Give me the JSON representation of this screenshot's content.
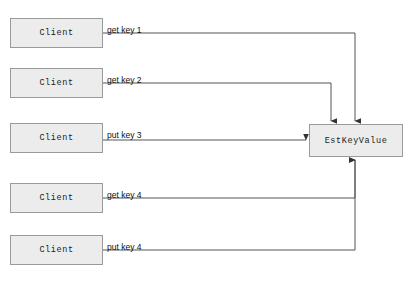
{
  "diagram": {
    "canvas": {
      "width": 413,
      "height": 281,
      "background": "#ffffff"
    },
    "colors": {
      "node_fill": "#ececec",
      "node_border": "#9a9a9a",
      "edge_line": "#555555",
      "label_text": "#111111"
    },
    "server": {
      "label": "EstKeyValue",
      "x": 309,
      "y": 124,
      "width": 94,
      "height": 33
    },
    "clients": [
      {
        "label": "Client",
        "x": 10,
        "y": 18,
        "width": 93,
        "height": 30
      },
      {
        "label": "Client",
        "x": 10,
        "y": 68,
        "width": 93,
        "height": 30
      },
      {
        "label": "Client",
        "x": 10,
        "y": 123,
        "width": 93,
        "height": 30
      },
      {
        "label": "Client",
        "x": 10,
        "y": 183,
        "width": 93,
        "height": 30
      },
      {
        "label": "Client",
        "x": 10,
        "y": 235,
        "width": 93,
        "height": 30
      }
    ],
    "edges": [
      {
        "label": "get key 1",
        "from_client": 0,
        "to_port": "top",
        "label_x": 107,
        "label_y": 26,
        "path": "M 103 33 L 355 33 L 355 121",
        "arrow": "down"
      },
      {
        "label": "get key 2",
        "from_client": 1,
        "to_port": "top",
        "label_x": 107,
        "label_y": 76,
        "path": "M 103 83 L 331 83 L 331 121",
        "arrow": "down"
      },
      {
        "label": "put key 3",
        "from_client": 2,
        "to_port": "left",
        "label_x": 107,
        "label_y": 131,
        "path": "M 103 140 L 306 140",
        "arrow": "right"
      },
      {
        "label": "get key 4",
        "from_client": 3,
        "to_port": "bottom",
        "label_x": 107,
        "label_y": 191,
        "path": "M 103 198 L 355 198 L 355 160",
        "arrow": "up"
      },
      {
        "label": "put key 4",
        "from_client": 4,
        "to_port": "bottom",
        "label_x": 107,
        "label_y": 243,
        "path": "M 103 250 L 355 250 L 355 160",
        "arrow": "up"
      }
    ]
  }
}
